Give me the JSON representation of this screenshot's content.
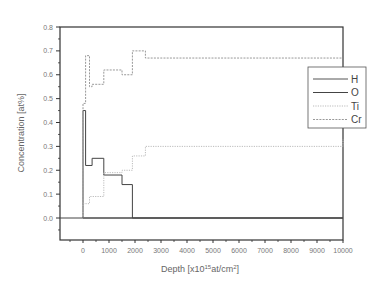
{
  "chart_data": {
    "type": "line",
    "title": "",
    "xlabel": "Depth [x10^15 at/cm^2]",
    "xlabel_parts": {
      "pre": "Depth [x10",
      "sup1": "15",
      "mid": "at/cm",
      "sup2": "2",
      "post": "]"
    },
    "ylabel": "Concentration [at%]",
    "xlim": [
      -900,
      10000
    ],
    "ylim": [
      -0.08,
      0.8
    ],
    "xticks": [
      0,
      1000,
      2000,
      3000,
      4000,
      5000,
      6000,
      7000,
      8000,
      9000,
      10000
    ],
    "xtick_labels": [
      "0",
      "1000",
      "2000",
      "3000",
      "4000",
      "5000",
      "6000",
      "7000",
      "8000",
      "9000",
      "10000"
    ],
    "yticks": [
      0.0,
      0.1,
      0.2,
      0.3,
      0.4,
      0.5,
      0.6,
      0.7,
      0.8
    ],
    "ytick_labels": [
      "0.0",
      "0.1",
      "0.2",
      "0.3",
      "0.4",
      "0.5",
      "0.6",
      "0.7",
      "0.8"
    ],
    "grid": false,
    "legend_position": "right",
    "step": true,
    "series": [
      {
        "name": "H",
        "style": "solid",
        "color": "#555555",
        "x": [
          0,
          10000
        ],
        "y": [
          0.0,
          0.0
        ]
      },
      {
        "name": "O",
        "style": "solid",
        "color": "#444444",
        "x": [
          0,
          100,
          350,
          800,
          1500,
          1900,
          10000
        ],
        "y": [
          0.45,
          0.22,
          0.25,
          0.18,
          0.14,
          0.0,
          0.0
        ]
      },
      {
        "name": "Ti",
        "style": "dotted",
        "color": "#bbbbbb",
        "x": [
          0,
          250,
          800,
          1500,
          1900,
          2400,
          10000
        ],
        "y": [
          0.06,
          0.09,
          0.19,
          0.2,
          0.26,
          0.3,
          0.33
        ]
      },
      {
        "name": "Cr",
        "style": "dashed",
        "color": "#999999",
        "x": [
          0,
          100,
          250,
          350,
          800,
          1500,
          1900,
          2400,
          10000
        ],
        "y": [
          0.48,
          0.68,
          0.55,
          0.56,
          0.62,
          0.6,
          0.7,
          0.67,
          0.67
        ]
      }
    ]
  },
  "layout": {
    "plot": {
      "left": 60,
      "right": 343,
      "top": 27,
      "bottom": 240
    },
    "x_zero_px": 83,
    "x_max_px": 343,
    "y_zero_px": 218,
    "y_top_px": 27,
    "legend": {
      "x": 308,
      "y": 67,
      "w": 58,
      "h": 61
    }
  }
}
